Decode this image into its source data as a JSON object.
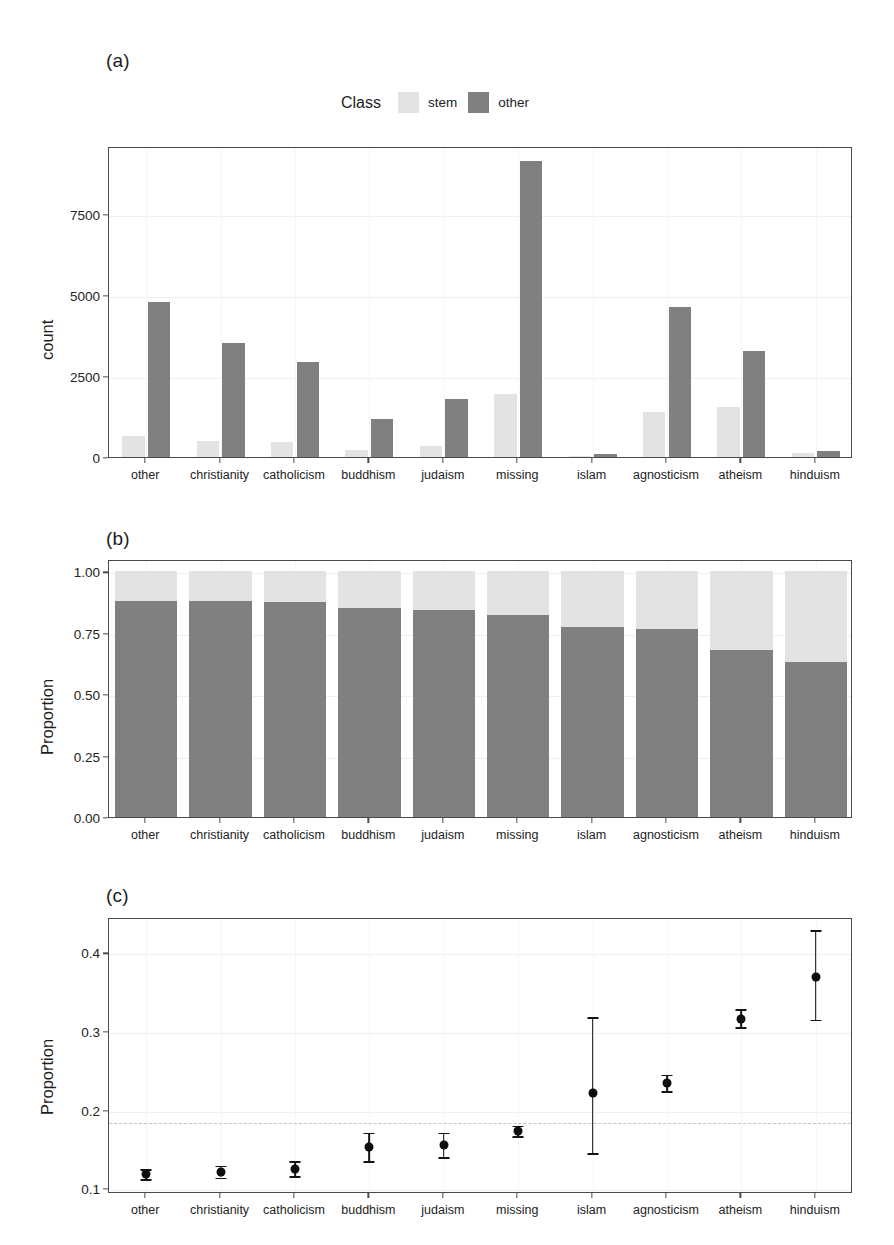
{
  "figure": {
    "panels": [
      {
        "tag": "(a)"
      },
      {
        "tag": "(b)"
      },
      {
        "tag": "(c)"
      }
    ]
  },
  "legend": {
    "title": "Class",
    "items": [
      {
        "label": "stem",
        "color": "#e3e3e3"
      },
      {
        "label": "other",
        "color": "#808080"
      }
    ]
  },
  "colors": {
    "stem": "#e3e3e3",
    "other": "#808080",
    "axis": "#4a4a4a",
    "point": "#0d0d0d",
    "refline": "#c4c4c4"
  },
  "categories": [
    "other",
    "christianity",
    "catholicism",
    "buddhism",
    "judaism",
    "missing",
    "islam",
    "agnosticism",
    "atheism",
    "hinduism"
  ],
  "chart_data": [
    {
      "type": "bar",
      "panel": "(a)",
      "title": "",
      "xlabel": "",
      "ylabel": "count",
      "categories": [
        "other",
        "christianity",
        "catholicism",
        "buddhism",
        "judaism",
        "missing",
        "islam",
        "agnosticism",
        "atheism",
        "hinduism"
      ],
      "series": [
        {
          "name": "stem",
          "values": [
            650,
            490,
            470,
            210,
            330,
            1960,
            30,
            1400,
            1530,
            110
          ]
        },
        {
          "name": "other",
          "values": [
            4800,
            3530,
            2930,
            1180,
            1780,
            9140,
            90,
            4630,
            3270,
            200
          ]
        }
      ],
      "ylim": [
        0,
        9600
      ],
      "yticks": [
        0,
        2500,
        5000,
        7500
      ],
      "ytick_labels": [
        "0",
        "2500",
        "5000",
        "7500"
      ],
      "grid": true,
      "legend_position": "top"
    },
    {
      "type": "bar",
      "panel": "(b)",
      "stacked": true,
      "title": "",
      "xlabel": "",
      "ylabel": "Proportion",
      "categories": [
        "other",
        "christianity",
        "catholicism",
        "buddhism",
        "judaism",
        "missing",
        "islam",
        "agnosticism",
        "atheism",
        "hinduism"
      ],
      "series": [
        {
          "name": "other",
          "values": [
            0.881,
            0.878,
            0.876,
            0.849,
            0.842,
            0.824,
            0.775,
            0.766,
            0.681,
            0.629
          ]
        },
        {
          "name": "stem",
          "values": [
            0.119,
            0.122,
            0.124,
            0.151,
            0.158,
            0.176,
            0.225,
            0.234,
            0.319,
            0.371
          ]
        }
      ],
      "ylim": [
        0,
        1.05
      ],
      "yticks": [
        0.0,
        0.25,
        0.5,
        0.75,
        1.0
      ],
      "ytick_labels": [
        "0.00",
        "0.25",
        "0.50",
        "0.75",
        "1.00"
      ],
      "grid": true
    },
    {
      "type": "scatter",
      "panel": "(c)",
      "title": "",
      "xlabel": "",
      "ylabel": "Proportion",
      "categories": [
        "other",
        "christianity",
        "catholicism",
        "buddhism",
        "judaism",
        "missing",
        "islam",
        "agnosticism",
        "atheism",
        "hinduism"
      ],
      "values": [
        0.12,
        0.123,
        0.127,
        0.155,
        0.157,
        0.175,
        0.223,
        0.236,
        0.318,
        0.371
      ],
      "ci_lower": [
        0.114,
        0.116,
        0.118,
        0.137,
        0.142,
        0.169,
        0.147,
        0.226,
        0.307,
        0.317
      ],
      "ci_upper": [
        0.127,
        0.131,
        0.137,
        0.173,
        0.173,
        0.182,
        0.32,
        0.247,
        0.33,
        0.431
      ],
      "reference_line": 0.185,
      "ylim": [
        0.095,
        0.445
      ],
      "yticks": [
        0.1,
        0.2,
        0.3,
        0.4
      ],
      "ytick_labels": [
        "0.1",
        "0.2",
        "0.3",
        "0.4"
      ],
      "grid": true,
      "errorbars": true
    }
  ]
}
